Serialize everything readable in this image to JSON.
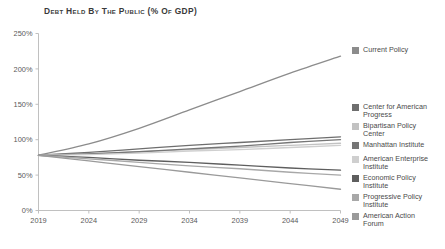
{
  "chart": {
    "title": "Debt Held by the Public (% of GDP)"
  },
  "chart_data": {
    "type": "line",
    "title": "Debt Held by the Public (% of GDP)",
    "xlabel": "",
    "ylabel": "",
    "xlim": [
      2019,
      2049
    ],
    "ylim": [
      0,
      250
    ],
    "grid": false,
    "legend_position": "right",
    "x_ticks": [
      "2019",
      "2024",
      "2029",
      "2034",
      "2039",
      "2044",
      "2049"
    ],
    "y_ticks": [
      "0%",
      "50%",
      "100%",
      "150%",
      "200%",
      "250%"
    ],
    "x": [
      2019,
      2024,
      2029,
      2034,
      2039,
      2044,
      2049
    ],
    "series": [
      {
        "name": "Current Policy",
        "color": "#8c8c8c",
        "values": [
          78,
          94,
          116,
          142,
          168,
          194,
          218
        ]
      },
      {
        "name": "Center for American Progress",
        "color": "#6e6e6e",
        "values": [
          78,
          82,
          87,
          92,
          96,
          100,
          104
        ]
      },
      {
        "name": "Bipartisan Policy Center",
        "color": "#c2c2c2",
        "values": [
          78,
          80,
          83,
          86,
          89,
          92,
          95
        ]
      },
      {
        "name": "Manhattan Institute",
        "color": "#767676",
        "values": [
          78,
          80,
          83,
          87,
          91,
          96,
          100
        ]
      },
      {
        "name": "American Enterprise Institute",
        "color": "#cfcfcf",
        "values": [
          78,
          79,
          81,
          84,
          86,
          89,
          92
        ]
      },
      {
        "name": "Economic Policy Institute",
        "color": "#5e5e5e",
        "values": [
          78,
          75,
          71,
          68,
          64,
          60,
          57
        ]
      },
      {
        "name": "Progressive Policy Institute",
        "color": "#a8a8a8",
        "values": [
          78,
          73,
          68,
          63,
          59,
          54,
          50
        ]
      },
      {
        "name": "American Action Forum",
        "color": "#9a9a9a",
        "values": [
          78,
          70,
          62,
          54,
          46,
          38,
          30
        ]
      }
    ]
  },
  "legend": {
    "groups": [
      {
        "items": [
          {
            "label": "Current Policy",
            "color": "#8c8c8c",
            "top": 46
          }
        ]
      },
      {
        "items": [
          {
            "label": "Center for American Progress",
            "color": "#6e6e6e",
            "top": 103
          },
          {
            "label": "Bipartisan Policy Center",
            "color": "#c2c2c2",
            "top": 122
          },
          {
            "label": "Manhattan Institute",
            "color": "#767676",
            "top": 141
          },
          {
            "label": "American Enterprise Institute",
            "color": "#cfcfcf",
            "top": 155
          },
          {
            "label": "Economic Policy Institute",
            "color": "#5e5e5e",
            "top": 174
          },
          {
            "label": "Progressive Policy Institute",
            "color": "#a8a8a8",
            "top": 193
          },
          {
            "label": "American Action Forum",
            "color": "#9a9a9a",
            "top": 212
          }
        ]
      }
    ]
  },
  "axes": {
    "line_color": "#b9b9b9",
    "tick_color": "#5a5a5a"
  }
}
